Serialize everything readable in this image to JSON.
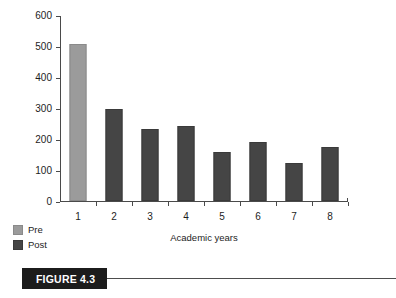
{
  "figure": {
    "caption_label": "FIGURE 4.3"
  },
  "legend": {
    "items": [
      {
        "label": "Pre",
        "color": "#9b9b9b",
        "series": "pre"
      },
      {
        "label": "Post",
        "color": "#454545",
        "series": "post"
      }
    ]
  },
  "chart_data": {
    "type": "bar",
    "title": "",
    "xlabel": "Academic years",
    "ylabel": "Office referrals per 100 students",
    "categories": [
      "1",
      "2",
      "3",
      "4",
      "5",
      "6",
      "7",
      "8"
    ],
    "values": [
      500,
      290,
      227,
      237,
      152,
      183,
      117,
      168
    ],
    "bar_series": [
      "Pre",
      "Post",
      "Post",
      "Post",
      "Post",
      "Post",
      "Post",
      "Post"
    ],
    "series": [
      {
        "name": "Pre",
        "color": "#9b9b9b",
        "values": [
          500,
          null,
          null,
          null,
          null,
          null,
          null,
          null
        ]
      },
      {
        "name": "Post",
        "color": "#454545",
        "values": [
          null,
          290,
          227,
          237,
          152,
          183,
          117,
          168
        ]
      }
    ],
    "ylim": [
      0,
      600
    ],
    "ytick_values": [
      0,
      100,
      200,
      300,
      400,
      500,
      600
    ],
    "ytick_labels": [
      "0",
      "100",
      "200",
      "300",
      "400",
      "500",
      "600"
    ],
    "grid": false,
    "legend_position": "bottom-left"
  }
}
